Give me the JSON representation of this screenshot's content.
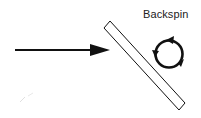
{
  "diagram": {
    "label": "Backspin",
    "elements": [
      {
        "type": "arrow",
        "meaning": "incoming-direction"
      },
      {
        "type": "paddle",
        "meaning": "angled-surface"
      },
      {
        "type": "rotation-arrow",
        "meaning": "backspin"
      }
    ],
    "colors": {
      "stroke": "#111111",
      "background": "#ffffff"
    }
  }
}
